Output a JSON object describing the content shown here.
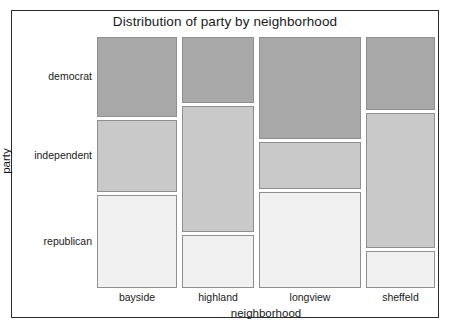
{
  "chart_data": {
    "type": "mosaic",
    "title": "Distribution of party by neighborhood",
    "xlabel": "neighborhood",
    "ylabel": "party",
    "grid": false,
    "legend": "none",
    "categories": [
      "bayside",
      "highland",
      "longview",
      "sheffeld"
    ],
    "row_categories": [
      "democrat",
      "independent",
      "republican"
    ],
    "column_widths_px": [
      80,
      72,
      102,
      69
    ],
    "column_width_fractions": [
      0.2488,
      0.2239,
      0.3172,
      0.2146
    ],
    "row_colors": {
      "democrat": "#a8a8a8",
      "independent": "#c9c9c9",
      "republican": "#f1f1f1"
    },
    "tile_border_color": "#8f8f8f",
    "frame_color": "#2b2b2b",
    "background": "#ffffff",
    "cells": [
      {
        "column": "bayside",
        "rows": [
          {
            "row": "democrat",
            "fraction": 0.3267,
            "color": "#a8a8a8"
          },
          {
            "row": "independent",
            "fraction": 0.2948,
            "color": "#c9c9c9"
          },
          {
            "row": "republican",
            "fraction": 0.3785,
            "color": "#f1f1f1"
          }
        ]
      },
      {
        "column": "highland",
        "rows": [
          {
            "row": "democrat",
            "fraction": 0.2709,
            "color": "#a8a8a8"
          },
          {
            "row": "independent",
            "fraction": 0.5139,
            "color": "#c9c9c9"
          },
          {
            "row": "republican",
            "fraction": 0.2152,
            "color": "#f1f1f1"
          }
        ]
      },
      {
        "column": "longview",
        "rows": [
          {
            "row": "democrat",
            "fraction": 0.4143,
            "color": "#a8a8a8"
          },
          {
            "row": "independent",
            "fraction": 0.1952,
            "color": "#c9c9c9"
          },
          {
            "row": "republican",
            "fraction": 0.3905,
            "color": "#f1f1f1"
          }
        ]
      },
      {
        "column": "sheffeld",
        "rows": [
          {
            "row": "democrat",
            "fraction": 0.2988,
            "color": "#a8a8a8"
          },
          {
            "row": "independent",
            "fraction": 0.5498,
            "color": "#c9c9c9"
          },
          {
            "row": "republican",
            "fraction": 0.1514,
            "color": "#f1f1f1"
          }
        ]
      }
    ]
  },
  "axes": {
    "x": {
      "title": "neighborhood",
      "ticks": [
        "bayside",
        "highland",
        "longview",
        "sheffeld"
      ]
    },
    "y": {
      "title": "party",
      "ticks": [
        "democrat",
        "independent",
        "republican"
      ]
    }
  }
}
